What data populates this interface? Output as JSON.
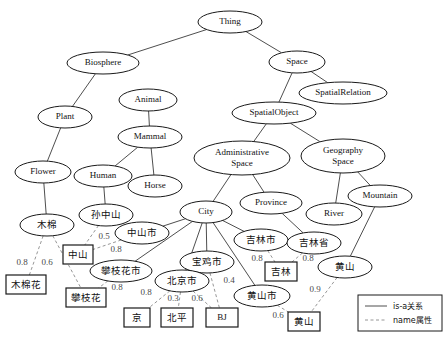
{
  "diagram": {
    "classes": [
      {
        "id": "thing",
        "label": "Thing",
        "cx": 230,
        "cy": 22,
        "rx": 32,
        "ry": 11,
        "script": "en"
      },
      {
        "id": "biosphere",
        "label": "Biosphere",
        "cx": 103,
        "cy": 63,
        "rx": 36,
        "ry": 11,
        "script": "en"
      },
      {
        "id": "space",
        "label": "Space",
        "cx": 297,
        "cy": 62,
        "rx": 28,
        "ry": 11,
        "script": "en"
      },
      {
        "id": "spatialrelation",
        "label": "SpatialRelation",
        "cx": 343,
        "cy": 93,
        "rx": 44,
        "ry": 11,
        "script": "en"
      },
      {
        "id": "spatialobject",
        "label": "SpatialObject",
        "cx": 274,
        "cy": 113,
        "rx": 42,
        "ry": 11,
        "script": "en"
      },
      {
        "id": "animal",
        "label": "Animal",
        "cx": 148,
        "cy": 100,
        "rx": 29,
        "ry": 11,
        "script": "en"
      },
      {
        "id": "plant",
        "label": "Plant",
        "cx": 65,
        "cy": 117,
        "rx": 27,
        "ry": 11,
        "script": "en"
      },
      {
        "id": "mammal",
        "label": "Mammal",
        "cx": 150,
        "cy": 137,
        "rx": 32,
        "ry": 11,
        "script": "en"
      },
      {
        "id": "adminspace",
        "label": "Administrative\nSpace",
        "cx": 242,
        "cy": 158,
        "rx": 48,
        "ry": 17,
        "script": "en"
      },
      {
        "id": "geospace",
        "label": "Geography\nSpace",
        "cx": 343,
        "cy": 156,
        "rx": 42,
        "ry": 17,
        "script": "en"
      },
      {
        "id": "flower",
        "label": "Flower",
        "cx": 43,
        "cy": 172,
        "rx": 28,
        "ry": 11,
        "script": "en"
      },
      {
        "id": "human",
        "label": "Human",
        "cx": 103,
        "cy": 176,
        "rx": 29,
        "ry": 11,
        "script": "en"
      },
      {
        "id": "horse",
        "label": "Horse",
        "cx": 155,
        "cy": 186,
        "rx": 27,
        "ry": 11,
        "script": "en"
      },
      {
        "id": "province",
        "label": "Province",
        "cx": 271,
        "cy": 203,
        "rx": 31,
        "ry": 11,
        "script": "en"
      },
      {
        "id": "mountain",
        "label": "Mountain",
        "cx": 380,
        "cy": 196,
        "rx": 32,
        "ry": 11,
        "script": "en"
      },
      {
        "id": "river",
        "label": "River",
        "cx": 334,
        "cy": 214,
        "rx": 28,
        "ry": 11,
        "script": "en"
      },
      {
        "id": "city",
        "label": "City",
        "cx": 206,
        "cy": 212,
        "rx": 26,
        "ry": 11,
        "script": "en"
      },
      {
        "id": "mumian",
        "label": "木棉",
        "cx": 47,
        "cy": 225,
        "rx": 27,
        "ry": 11,
        "script": "cn"
      },
      {
        "id": "sunzhongshan",
        "label": "孙中山",
        "cx": 106,
        "cy": 215,
        "rx": 27,
        "ry": 11,
        "script": "cn"
      },
      {
        "id": "zhongshanshi",
        "label": "中山市",
        "cx": 142,
        "cy": 233,
        "rx": 27,
        "ry": 11,
        "script": "cn"
      },
      {
        "id": "jilinshi",
        "label": "吉林市",
        "cx": 261,
        "cy": 240,
        "rx": 27,
        "ry": 11,
        "script": "cn"
      },
      {
        "id": "jilinsheng",
        "label": "吉林省",
        "cx": 314,
        "cy": 243,
        "rx": 27,
        "ry": 11,
        "script": "cn"
      },
      {
        "id": "panzhihuashi",
        "label": "攀枝花市",
        "cx": 121,
        "cy": 271,
        "rx": 31,
        "ry": 11,
        "script": "cn"
      },
      {
        "id": "baojishi",
        "label": "宝鸡市",
        "cx": 207,
        "cy": 262,
        "rx": 27,
        "ry": 11,
        "script": "cn"
      },
      {
        "id": "beijingshi",
        "label": "北京市",
        "cx": 182,
        "cy": 281,
        "rx": 27,
        "ry": 11,
        "script": "cn"
      },
      {
        "id": "huangshanshi",
        "label": "黄山市",
        "cx": 262,
        "cy": 296,
        "rx": 28,
        "ry": 11,
        "script": "cn"
      },
      {
        "id": "huangshan_m",
        "label": "黄山",
        "cx": 345,
        "cy": 267,
        "rx": 27,
        "ry": 11,
        "script": "cn"
      }
    ],
    "instances": [
      {
        "id": "b_zhongshan",
        "label": "中山",
        "x": 63,
        "y": 245,
        "w": 30,
        "h": 19,
        "script": "cn"
      },
      {
        "id": "b_mumianhua",
        "label": "木棉花",
        "x": 6,
        "y": 275,
        "w": 40,
        "h": 19,
        "script": "cn"
      },
      {
        "id": "b_panzhihua",
        "label": "攀枝花",
        "x": 66,
        "y": 288,
        "w": 40,
        "h": 19,
        "script": "cn"
      },
      {
        "id": "b_jing",
        "label": "京",
        "x": 124,
        "y": 308,
        "w": 26,
        "h": 19,
        "script": "cn"
      },
      {
        "id": "b_beiping",
        "label": "北平",
        "x": 161,
        "y": 308,
        "w": 32,
        "h": 19,
        "script": "cn"
      },
      {
        "id": "b_bj",
        "label": "BJ",
        "x": 206,
        "y": 308,
        "w": 32,
        "h": 19,
        "script": "en"
      },
      {
        "id": "b_jilin",
        "label": "吉林",
        "x": 265,
        "y": 262,
        "w": 32,
        "h": 19,
        "script": "cn"
      },
      {
        "id": "b_huangshan",
        "label": "黄山",
        "x": 288,
        "y": 312,
        "w": 32,
        "h": 19,
        "script": "cn"
      }
    ],
    "isa_edges": [
      {
        "from": "biosphere",
        "to": "thing"
      },
      {
        "from": "space",
        "to": "thing"
      },
      {
        "from": "spatialrelation",
        "to": "space"
      },
      {
        "from": "spatialobject",
        "to": "space"
      },
      {
        "from": "plant",
        "to": "biosphere"
      },
      {
        "from": "mammal",
        "to": "animal"
      },
      {
        "from": "human",
        "to": "mammal"
      },
      {
        "from": "horse",
        "to": "mammal"
      },
      {
        "from": "flower",
        "to": "plant"
      },
      {
        "from": "adminspace",
        "to": "spatialobject"
      },
      {
        "from": "geospace",
        "to": "spatialobject"
      },
      {
        "from": "city",
        "to": "adminspace"
      },
      {
        "from": "province",
        "to": "adminspace"
      },
      {
        "from": "river",
        "to": "geospace"
      },
      {
        "from": "mountain",
        "to": "geospace"
      },
      {
        "from": "mumian",
        "to": "flower"
      },
      {
        "from": "sunzhongshan",
        "to": "human"
      },
      {
        "from": "zhongshanshi",
        "to": "city"
      },
      {
        "from": "panzhihuashi",
        "to": "city"
      },
      {
        "from": "beijingshi",
        "to": "city"
      },
      {
        "from": "baojishi",
        "to": "city"
      },
      {
        "from": "jilinshi",
        "to": "city"
      },
      {
        "from": "huangshanshi",
        "to": "city"
      },
      {
        "from": "jilinsheng",
        "to": "province"
      },
      {
        "from": "huangshan_m",
        "to": "mountain"
      }
    ],
    "name_edges": [
      {
        "from": "mumian",
        "to": "b_mumianhua",
        "weight": "0.8",
        "wx": 22,
        "wy": 263
      },
      {
        "from": "mumian",
        "to": "b_panzhihua",
        "weight": "0.6",
        "wx": 47,
        "wy": 263
      },
      {
        "from": "sunzhongshan",
        "to": "b_zhongshan",
        "weight": "0.5",
        "wx": 104,
        "wy": 237
      },
      {
        "from": "zhongshanshi",
        "to": "b_zhongshan",
        "weight": "0.8",
        "wx": 116,
        "wy": 250
      },
      {
        "from": "panzhihuashi",
        "to": "b_panzhihua",
        "weight": "0.8",
        "wx": 117,
        "wy": 288
      },
      {
        "from": "beijingshi",
        "to": "b_jing",
        "weight": "0.8",
        "wx": 146,
        "wy": 293
      },
      {
        "from": "beijingshi",
        "to": "b_beiping",
        "weight": "0.3",
        "wx": 173,
        "wy": 299
      },
      {
        "from": "beijingshi",
        "to": "b_bj",
        "weight": "0.6",
        "wx": 197,
        "wy": 299
      },
      {
        "from": "baojishi",
        "to": "b_bj",
        "weight": "0.4",
        "wx": 229,
        "wy": 281
      },
      {
        "from": "jilinshi",
        "to": "b_jilin",
        "weight": "0.8",
        "wx": 257,
        "wy": 259
      },
      {
        "from": "jilinsheng",
        "to": "b_jilin",
        "weight": "0.8",
        "wx": 308,
        "wy": 259
      },
      {
        "from": "huangshanshi",
        "to": "b_huangshan",
        "weight": "0.6",
        "wx": 278,
        "wy": 316
      },
      {
        "from": "huangshan_m",
        "to": "b_huangshan",
        "weight": "0.9",
        "wx": 315,
        "wy": 290
      }
    ],
    "legend": {
      "x": 358,
      "y": 295,
      "w": 84,
      "h": 36,
      "items": [
        {
          "id": "legend-isa",
          "style": "solid",
          "label": "is-a关系"
        },
        {
          "id": "legend-name",
          "style": "dashed",
          "label": "name属性"
        }
      ]
    }
  }
}
